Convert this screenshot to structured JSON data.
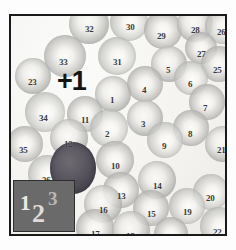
{
  "image": {
    "kind": "blood-smear-micrograph",
    "annotation": "+1",
    "background_color": "#f2f1ee",
    "border_color": "#1a1a1a",
    "label_color": "#3a3a3a",
    "stained_cell_color": "#4e4a54"
  },
  "legend": {
    "box_color": "#6a6a6a",
    "items": [
      "1",
      "2",
      "3"
    ]
  },
  "cells": [
    {
      "n": "32",
      "x": 78,
      "y": 8,
      "r": 20,
      "t": "d2",
      "lx": 74,
      "ly": 9
    },
    {
      "n": "30",
      "x": 118,
      "y": 6,
      "r": 19,
      "t": "d3",
      "lx": 115,
      "ly": 7
    },
    {
      "n": "29",
      "x": 152,
      "y": 14,
      "r": 19,
      "t": "",
      "lx": 146,
      "ly": 16
    },
    {
      "n": "28",
      "x": 184,
      "y": 8,
      "r": 18,
      "t": "d2",
      "lx": 180,
      "ly": 10
    },
    {
      "n": "26",
      "x": 212,
      "y": 10,
      "r": 18,
      "t": "d3",
      "lx": 206,
      "ly": 12
    },
    {
      "n": "27",
      "x": 190,
      "y": 32,
      "r": 16,
      "t": "",
      "lx": 186,
      "ly": 34
    },
    {
      "n": "33",
      "x": 54,
      "y": 40,
      "r": 21,
      "t": "",
      "lx": 48,
      "ly": 42
    },
    {
      "n": "31",
      "x": 106,
      "y": 40,
      "r": 19,
      "t": "d3",
      "lx": 102,
      "ly": 42
    },
    {
      "n": "5",
      "x": 158,
      "y": 48,
      "r": 18,
      "t": "d2",
      "lx": 155,
      "ly": 50
    },
    {
      "n": "25",
      "x": 208,
      "y": 48,
      "r": 18,
      "t": "",
      "lx": 202,
      "ly": 50
    },
    {
      "n": "6",
      "x": 180,
      "y": 62,
      "r": 17,
      "t": "d3",
      "lx": 177,
      "ly": 64
    },
    {
      "n": "4",
      "x": 134,
      "y": 68,
      "r": 18,
      "t": "",
      "lx": 131,
      "ly": 70
    },
    {
      "n": "1",
      "x": 102,
      "y": 78,
      "r": 18,
      "t": "d2",
      "lx": 99,
      "ly": 80
    },
    {
      "n": "7",
      "x": 196,
      "y": 86,
      "r": 18,
      "t": "",
      "lx": 192,
      "ly": 88
    },
    {
      "n": "34",
      "x": 34,
      "y": 96,
      "r": 20,
      "t": "d3",
      "lx": 28,
      "ly": 98
    },
    {
      "n": "11",
      "x": 74,
      "y": 98,
      "r": 18,
      "t": "",
      "lx": 70,
      "ly": 100
    },
    {
      "n": "3",
      "x": 134,
      "y": 102,
      "r": 18,
      "t": "d2",
      "lx": 130,
      "ly": 104
    },
    {
      "n": "2",
      "x": 98,
      "y": 112,
      "r": 19,
      "t": "d3",
      "lx": 94,
      "ly": 114
    },
    {
      "n": "8",
      "x": 180,
      "y": 112,
      "r": 18,
      "t": "",
      "lx": 177,
      "ly": 114
    },
    {
      "n": "12",
      "x": 58,
      "y": 122,
      "r": 19,
      "t": "d2",
      "lx": 53,
      "ly": 124
    },
    {
      "n": "9",
      "x": 154,
      "y": 124,
      "r": 18,
      "t": "d3",
      "lx": 151,
      "ly": 126
    },
    {
      "n": "35",
      "x": 14,
      "y": 128,
      "r": 18,
      "t": "",
      "lx": 8,
      "ly": 130
    },
    {
      "n": "21",
      "x": 212,
      "y": 128,
      "r": 18,
      "t": "d2",
      "lx": 206,
      "ly": 130
    },
    {
      "n": "10",
      "x": 104,
      "y": 144,
      "r": 19,
      "t": "",
      "lx": 100,
      "ly": 146
    },
    {
      "n": "36",
      "x": 36,
      "y": 158,
      "r": 19,
      "t": "d3",
      "lx": 31,
      "ly": 160
    },
    {
      "n": "14",
      "x": 146,
      "y": 164,
      "r": 19,
      "t": "d2",
      "lx": 142,
      "ly": 166
    },
    {
      "n": "13",
      "x": 110,
      "y": 174,
      "r": 18,
      "t": "",
      "lx": 106,
      "ly": 176
    },
    {
      "n": "20",
      "x": 200,
      "y": 176,
      "r": 18,
      "t": "d3",
      "lx": 195,
      "ly": 178
    },
    {
      "n": "16",
      "x": 92,
      "y": 188,
      "r": 19,
      "t": "d2",
      "lx": 88,
      "ly": 190
    },
    {
      "n": "15",
      "x": 140,
      "y": 192,
      "r": 18,
      "t": "",
      "lx": 136,
      "ly": 194
    },
    {
      "n": "19",
      "x": 176,
      "y": 190,
      "r": 18,
      "t": "d3",
      "lx": 172,
      "ly": 192
    },
    {
      "n": "17",
      "x": 84,
      "y": 212,
      "r": 19,
      "t": "",
      "lx": 80,
      "ly": 214
    },
    {
      "n": "18",
      "x": 120,
      "y": 214,
      "r": 19,
      "t": "d2",
      "lx": 115,
      "ly": 216
    },
    {
      "n": "22",
      "x": 208,
      "y": 210,
      "r": 19,
      "t": "d3",
      "lx": 202,
      "ly": 212
    },
    {
      "n": "23",
      "x": 22,
      "y": 60,
      "r": 18,
      "t": "d2",
      "lx": 17,
      "ly": 62
    },
    {
      "n": "24",
      "x": 160,
      "y": 218,
      "r": 17,
      "t": "",
      "lx": 156,
      "ly": 220
    }
  ],
  "stained_cell": {
    "x": 62,
    "y": 152,
    "rx": 23,
    "ry": 26
  }
}
